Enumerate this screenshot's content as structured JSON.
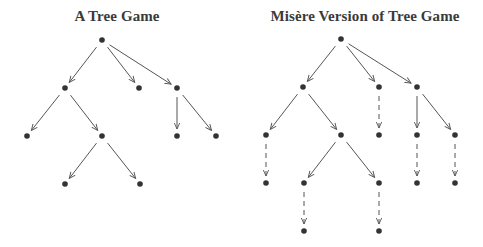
{
  "colors": {
    "node": "#333333",
    "edge": "#555555",
    "title": "#3a3a3a",
    "background": "#ffffff"
  },
  "trees": [
    {
      "id": "tree-game",
      "title": "A Tree Game",
      "title_x": 117,
      "nodes": [
        {
          "id": "r",
          "x": 102,
          "y": 40
        },
        {
          "id": "a",
          "x": 65,
          "y": 88
        },
        {
          "id": "b",
          "x": 139,
          "y": 88
        },
        {
          "id": "c",
          "x": 177,
          "y": 88
        },
        {
          "id": "a1",
          "x": 27,
          "y": 136
        },
        {
          "id": "a2",
          "x": 102,
          "y": 136
        },
        {
          "id": "c1",
          "x": 177,
          "y": 136
        },
        {
          "id": "c2",
          "x": 216,
          "y": 136
        },
        {
          "id": "a21",
          "x": 65,
          "y": 184
        },
        {
          "id": "a22",
          "x": 140,
          "y": 184
        }
      ],
      "edges": [
        {
          "from": "r",
          "to": "a",
          "style": "solid"
        },
        {
          "from": "r",
          "to": "b",
          "style": "solid"
        },
        {
          "from": "r",
          "to": "c",
          "style": "solid"
        },
        {
          "from": "a",
          "to": "a1",
          "style": "solid"
        },
        {
          "from": "a",
          "to": "a2",
          "style": "solid"
        },
        {
          "from": "c",
          "to": "c1",
          "style": "solid"
        },
        {
          "from": "c",
          "to": "c2",
          "style": "solid"
        },
        {
          "from": "a2",
          "to": "a21",
          "style": "solid"
        },
        {
          "from": "a2",
          "to": "a22",
          "style": "solid"
        }
      ]
    },
    {
      "id": "misere-tree-game",
      "title": "Misère Version of Tree Game",
      "title_x": 365,
      "nodes": [
        {
          "id": "r",
          "x": 341,
          "y": 39
        },
        {
          "id": "a",
          "x": 303,
          "y": 87
        },
        {
          "id": "b",
          "x": 379,
          "y": 87
        },
        {
          "id": "c",
          "x": 417,
          "y": 87
        },
        {
          "id": "a1",
          "x": 266,
          "y": 135
        },
        {
          "id": "a2",
          "x": 341,
          "y": 135
        },
        {
          "id": "b1",
          "x": 379,
          "y": 135
        },
        {
          "id": "c1",
          "x": 417,
          "y": 135
        },
        {
          "id": "c2",
          "x": 455,
          "y": 135
        },
        {
          "id": "a1x",
          "x": 266,
          "y": 183
        },
        {
          "id": "a21",
          "x": 304,
          "y": 183
        },
        {
          "id": "a22",
          "x": 379,
          "y": 183
        },
        {
          "id": "c1x",
          "x": 417,
          "y": 183
        },
        {
          "id": "c2x",
          "x": 455,
          "y": 183
        },
        {
          "id": "a21x",
          "x": 304,
          "y": 231
        },
        {
          "id": "a22x",
          "x": 379,
          "y": 231
        }
      ],
      "edges": [
        {
          "from": "r",
          "to": "a",
          "style": "solid"
        },
        {
          "from": "r",
          "to": "b",
          "style": "solid"
        },
        {
          "from": "r",
          "to": "c",
          "style": "solid"
        },
        {
          "from": "a",
          "to": "a1",
          "style": "solid"
        },
        {
          "from": "a",
          "to": "a2",
          "style": "solid"
        },
        {
          "from": "b",
          "to": "b1",
          "style": "dashed"
        },
        {
          "from": "c",
          "to": "c1",
          "style": "solid"
        },
        {
          "from": "c",
          "to": "c2",
          "style": "solid"
        },
        {
          "from": "a1",
          "to": "a1x",
          "style": "dashed"
        },
        {
          "from": "a2",
          "to": "a21",
          "style": "solid"
        },
        {
          "from": "a2",
          "to": "a22",
          "style": "solid"
        },
        {
          "from": "c1",
          "to": "c1x",
          "style": "dashed"
        },
        {
          "from": "c2",
          "to": "c2x",
          "style": "dashed"
        },
        {
          "from": "a21",
          "to": "a21x",
          "style": "dashed"
        },
        {
          "from": "a22",
          "to": "a22x",
          "style": "dashed"
        }
      ]
    }
  ]
}
